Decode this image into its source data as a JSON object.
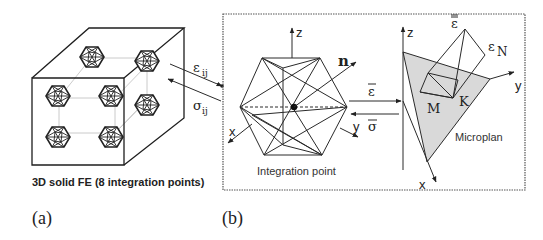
{
  "panel_a": {
    "caption": "3D solid FE (8 integration points)",
    "label": "(a)",
    "strain_symbol": "ε",
    "strain_sub": "ij",
    "stress_symbol": "σ",
    "stress_sub": "ij"
  },
  "panel_b": {
    "label": "(b)",
    "integration_point_caption": "Integration point",
    "normal_label": "n",
    "axis_x": "x",
    "axis_y": "y",
    "axis_z": "z",
    "strain_bar": "ε",
    "stress_bar": "σ",
    "microplane": {
      "caption": "Microplan",
      "axis_x": "x",
      "axis_y": "y",
      "axis_z": "z",
      "strain_bar": "ε",
      "normal_strain_symbol": "ε",
      "normal_strain_sub": "N",
      "point_M": "M",
      "point_K": "K",
      "plane_fill": "#d9d9d9"
    }
  },
  "colors": {
    "line": "#2a2a2a",
    "background": "#ffffff",
    "box_border": "#555555"
  }
}
